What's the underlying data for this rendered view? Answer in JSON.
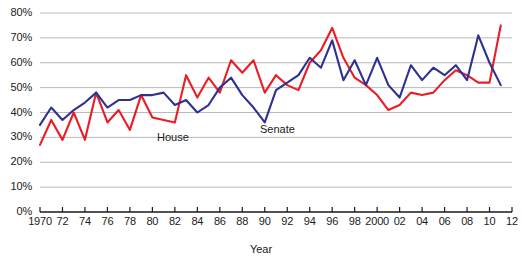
{
  "chart_data": {
    "type": "line",
    "title": "",
    "xlabel": "Year",
    "ylabel": "",
    "ylim": [
      0,
      80
    ],
    "xlim": [
      1970,
      2012
    ],
    "grid": true,
    "legend_position": "inline-annotations",
    "ytick_labels": [
      "0%",
      "10%",
      "20%",
      "30%",
      "40%",
      "50%",
      "60%",
      "70%",
      "80%"
    ],
    "ytick_values": [
      0,
      10,
      20,
      30,
      40,
      50,
      60,
      70,
      80
    ],
    "xtick_labels": [
      "1970",
      "72",
      "74",
      "76",
      "78",
      "80",
      "82",
      "84",
      "86",
      "88",
      "90",
      "92",
      "94",
      "96",
      "98",
      "2000",
      "02",
      "04",
      "06",
      "08",
      "10",
      "12"
    ],
    "xtick_values": [
      1970,
      1972,
      1974,
      1976,
      1978,
      1980,
      1982,
      1984,
      1986,
      1988,
      1990,
      1992,
      1994,
      1996,
      1998,
      2000,
      2002,
      2004,
      2006,
      2008,
      2010,
      2012
    ],
    "x": [
      1970,
      1971,
      1972,
      1973,
      1974,
      1975,
      1976,
      1977,
      1978,
      1979,
      1980,
      1981,
      1982,
      1983,
      1984,
      1985,
      1986,
      1987,
      1988,
      1989,
      1990,
      1991,
      1992,
      1993,
      1994,
      1995,
      1996,
      1997,
      1998,
      1999,
      2000,
      2001,
      2002,
      2003,
      2004,
      2005,
      2006,
      2007,
      2008,
      2009,
      2010,
      2011
    ],
    "series": [
      {
        "name": "House",
        "color": "#ED1C24",
        "values": [
          27,
          37,
          29,
          40,
          29,
          48,
          36,
          41,
          33,
          47,
          38,
          37,
          36,
          55,
          46,
          54,
          48,
          61,
          56,
          61,
          48,
          55,
          51,
          49,
          60,
          65,
          74,
          62,
          54,
          51,
          47,
          41,
          43,
          48,
          47,
          48,
          53,
          57,
          55,
          52,
          52,
          75
        ]
      },
      {
        "name": "Senate",
        "color": "#2E3192",
        "values": [
          35,
          42,
          37,
          41,
          44,
          48,
          42,
          45,
          45,
          47,
          47,
          48,
          43,
          45,
          40,
          43,
          50,
          54,
          47,
          42,
          36,
          49,
          52,
          55,
          62,
          58,
          69,
          53,
          61,
          51,
          62,
          51,
          46,
          59,
          53,
          58,
          55,
          59,
          53,
          71,
          60,
          51
        ]
      }
    ],
    "annotations": [
      {
        "text": "House",
        "x": 1983,
        "y": 31,
        "series": "House"
      },
      {
        "text": "Senate",
        "x": 1991,
        "y": 33,
        "series": "Senate"
      }
    ]
  },
  "colors": {
    "house_line": "#ED1C24",
    "senate_line": "#2E3192",
    "gridline": "#b9b9b9",
    "axis": "#1a1a1a",
    "text": "#1a1a1a",
    "background": "#ffffff"
  }
}
